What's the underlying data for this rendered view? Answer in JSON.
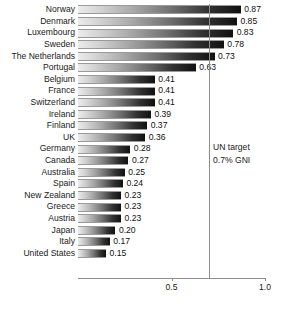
{
  "chart_data": {
    "type": "bar",
    "orientation": "horizontal",
    "title": "",
    "xlabel": "",
    "ylabel": "",
    "xlim": [
      0,
      1.0
    ],
    "xticks": [
      0.5,
      1.0
    ],
    "xtick_labels": [
      "0.5",
      "1.0"
    ],
    "grid": false,
    "legend": null,
    "value_format": "2dp",
    "categories": [
      "Norway",
      "Denmark",
      "Luxembourg",
      "Sweden",
      "The Netherlands",
      "Portugal",
      "Belgium",
      "France",
      "Switzerland",
      "Ireland",
      "Finland",
      "UK",
      "Germany",
      "Canada",
      "Australia",
      "Spain",
      "New Zealand",
      "Greece",
      "Austria",
      "Japan",
      "Italy",
      "United States"
    ],
    "values": [
      0.87,
      0.85,
      0.83,
      0.78,
      0.73,
      0.63,
      0.41,
      0.41,
      0.41,
      0.39,
      0.37,
      0.36,
      0.28,
      0.27,
      0.25,
      0.24,
      0.23,
      0.23,
      0.23,
      0.2,
      0.17,
      0.15
    ],
    "value_labels": [
      "0.87",
      "0.85",
      "0.83",
      "0.78",
      "0.73",
      "0.63",
      "0.41",
      "0.41",
      "0.41",
      "0.39",
      "0.37",
      "0.36",
      "0.28",
      "0.27",
      "0.25",
      "0.24",
      "0.23",
      "0.23",
      "0.23",
      "0.20",
      "0.17",
      "0.15"
    ],
    "annotations": [
      {
        "name": "un-target",
        "value": 0.7,
        "line1": "UN target",
        "line2": "0.7% GNI"
      }
    ],
    "colors": {
      "bar_gradient_start": "#ececec",
      "bar_gradient_end": "#111111",
      "bar_outline": "#9a9a9a",
      "axis": "#8e8e8e",
      "text": "#1a1a1a",
      "background": "#ffffff"
    }
  }
}
